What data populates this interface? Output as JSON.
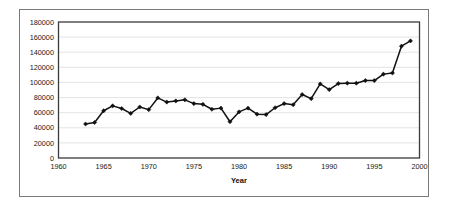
{
  "chart_data": {
    "type": "line",
    "title": "",
    "xlabel": "Year",
    "ylabel": "",
    "xlim": [
      1960,
      2000
    ],
    "ylim": [
      0,
      180000
    ],
    "grid": true,
    "legend": "none",
    "marker": "diamond",
    "line_color": "#111111",
    "grid_color": "#d9d9d9",
    "xticks": [
      1960,
      1965,
      1970,
      1975,
      1980,
      1985,
      1990,
      1995,
      2000
    ],
    "xtick_labels": [
      "1960",
      "1965",
      "1970",
      "1975",
      "1980",
      "1985",
      "1990",
      "1995",
      "2000"
    ],
    "yticks": [
      0,
      20000,
      40000,
      60000,
      80000,
      100000,
      120000,
      140000,
      160000,
      180000
    ],
    "ytick_labels": [
      "0",
      "20000",
      "40000",
      "60000",
      "80000",
      "100000",
      "120000",
      "140000",
      "160000",
      "180000"
    ],
    "x": [
      1963,
      1964,
      1965,
      1966,
      1967,
      1968,
      1969,
      1970,
      1971,
      1972,
      1973,
      1974,
      1975,
      1976,
      1977,
      1978,
      1979,
      1980,
      1981,
      1982,
      1983,
      1984,
      1985,
      1986,
      1987,
      1988,
      1989,
      1990,
      1991,
      1992,
      1993,
      1994,
      1995,
      1996,
      1997,
      1998,
      1999
    ],
    "values": [
      45000,
      47000,
      62500,
      69000,
      65500,
      59000,
      67500,
      64000,
      79500,
      74000,
      75500,
      77000,
      72000,
      71000,
      64500,
      66000,
      48000,
      61000,
      66000,
      58000,
      57500,
      66500,
      72000,
      70500,
      84000,
      78500,
      98000,
      90500,
      98500,
      99000,
      99000,
      102500,
      102500,
      111000,
      112500,
      148000,
      155000
    ]
  }
}
